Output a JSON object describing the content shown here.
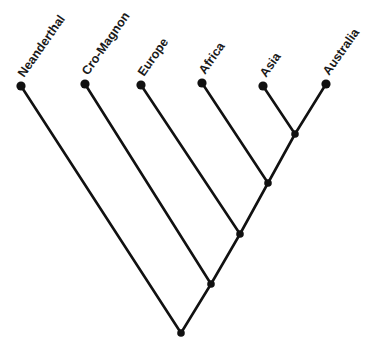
{
  "figure": {
    "type": "phylogenetic-tree",
    "title": "",
    "background_color": "#ffffff",
    "line_color": "#111111",
    "node_color": "#111111",
    "label_color": "#1a1a1a",
    "label_rotation_degrees": -55,
    "width": 377,
    "height": 355
  },
  "chart_data": {
    "type": "diagram",
    "subtype": "cladogram",
    "title": "",
    "xlabel": "",
    "ylabel": "",
    "grid": false,
    "legend": "none",
    "tips": [
      {
        "id": "neanderthal",
        "label": "Neanderthal",
        "x": 21,
        "y": 86
      },
      {
        "id": "cro-magnon",
        "label": "Cro-Magnon",
        "x": 85,
        "y": 84
      },
      {
        "id": "europe",
        "label": "Europe",
        "x": 141,
        "y": 85
      },
      {
        "id": "africa",
        "label": "Africa",
        "x": 202,
        "y": 83
      },
      {
        "id": "asia",
        "label": "Asia",
        "x": 263,
        "y": 86
      },
      {
        "id": "australia",
        "label": "Australia",
        "x": 326,
        "y": 84
      }
    ],
    "internal_nodes": [
      {
        "id": "node-asia-australia",
        "x": 295,
        "y": 134,
        "children": [
          "asia",
          "australia"
        ]
      },
      {
        "id": "node-africa-clade",
        "x": 268,
        "y": 183,
        "children": [
          "africa",
          "node-asia-australia"
        ]
      },
      {
        "id": "node-europe-clade",
        "x": 240,
        "y": 234,
        "children": [
          "europe",
          "node-africa-clade"
        ]
      },
      {
        "id": "node-cromagnon-clade",
        "x": 211,
        "y": 284,
        "children": [
          "cro-magnon",
          "node-europe-clade"
        ]
      },
      {
        "id": "node-root",
        "x": 181,
        "y": 333,
        "children": [
          "neanderthal",
          "node-cromagnon-clade"
        ]
      }
    ],
    "branches": [
      {
        "id": "branch-neanderthal",
        "from": "neanderthal",
        "to": "node-root",
        "x1": 21,
        "y1": 86,
        "x2": 181,
        "y2": 333
      },
      {
        "id": "branch-cro-magnon",
        "from": "cro-magnon",
        "to": "node-cromagnon-clade",
        "x1": 85,
        "y1": 84,
        "x2": 211,
        "y2": 284
      },
      {
        "id": "branch-europe",
        "from": "europe",
        "to": "node-europe-clade",
        "x1": 141,
        "y1": 85,
        "x2": 240,
        "y2": 234
      },
      {
        "id": "branch-africa",
        "from": "africa",
        "to": "node-africa-clade",
        "x1": 202,
        "y1": 83,
        "x2": 268,
        "y2": 183
      },
      {
        "id": "branch-asia",
        "from": "asia",
        "to": "node-asia-australia",
        "x1": 263,
        "y1": 86,
        "x2": 295,
        "y2": 134
      },
      {
        "id": "branch-australia",
        "from": "australia",
        "to": "node-asia-australia",
        "x1": 326,
        "y1": 84,
        "x2": 295,
        "y2": 134
      },
      {
        "id": "branch-asia-australia-stem",
        "from": "node-asia-australia",
        "to": "node-africa-clade",
        "x1": 295,
        "y1": 134,
        "x2": 268,
        "y2": 183
      },
      {
        "id": "branch-africa-clade-stem",
        "from": "node-africa-clade",
        "to": "node-europe-clade",
        "x1": 268,
        "y1": 183,
        "x2": 240,
        "y2": 234
      },
      {
        "id": "branch-europe-clade-stem",
        "from": "node-europe-clade",
        "to": "node-cromagnon-clade",
        "x1": 240,
        "y1": 234,
        "x2": 211,
        "y2": 284
      },
      {
        "id": "branch-cromagnon-clade-stem",
        "from": "node-cromagnon-clade",
        "to": "node-root",
        "x1": 211,
        "y1": 284,
        "x2": 181,
        "y2": 333
      }
    ],
    "tip_marker_radius": 4.6,
    "internal_marker_radius": 3.8
  }
}
